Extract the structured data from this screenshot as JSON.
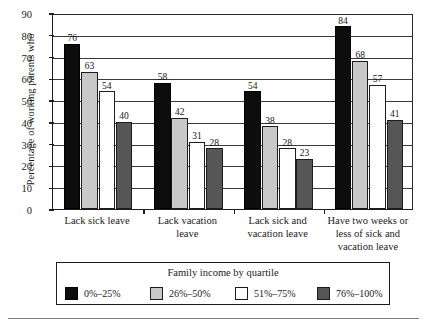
{
  "chart_data": {
    "type": "bar",
    "title": "",
    "xlabel": "",
    "ylabel": "Percentage of working parents who",
    "ylim": [
      0,
      90
    ],
    "yticks": [
      0,
      10,
      20,
      30,
      40,
      50,
      60,
      70,
      80,
      90
    ],
    "grid": true,
    "legend_position": "bottom",
    "legend_title": "Family income by quartile",
    "categories": [
      "Lack sick leave",
      "Lack vacation leave",
      "Lack sick and vacation leave",
      "Have two weeks or less of sick and vacation leave"
    ],
    "series": [
      {
        "name": "0%–25%",
        "color": "#0d0d0d",
        "values": [
          76,
          58,
          54,
          84
        ]
      },
      {
        "name": "26%–50%",
        "color": "#c8c8c8",
        "values": [
          63,
          42,
          38,
          68
        ]
      },
      {
        "name": "51%–75%",
        "color": "#ffffff",
        "values": [
          54,
          31,
          28,
          57
        ]
      },
      {
        "name": "76%–100%",
        "color": "#565656",
        "values": [
          40,
          28,
          23,
          41
        ]
      }
    ]
  },
  "axis": {
    "y_title": "Percentage of working parents who",
    "y_tick_labels": [
      "0",
      "10",
      "20",
      "30",
      "40",
      "50",
      "60",
      "70",
      "80",
      "90"
    ]
  },
  "category_labels": [
    [
      "Lack sick leave"
    ],
    [
      "Lack vacation",
      "leave"
    ],
    [
      "Lack sick and",
      "vacation leave"
    ],
    [
      "Have two weeks or",
      "less of sick and",
      "vacation leave"
    ]
  ],
  "legend": {
    "title": "Family income by quartile",
    "items": [
      {
        "label": "0%–25%",
        "swatch": "q1"
      },
      {
        "label": "26%–50%",
        "swatch": "q2"
      },
      {
        "label": "51%–75%",
        "swatch": "q3"
      },
      {
        "label": "76%–100%",
        "swatch": "q4"
      }
    ]
  }
}
